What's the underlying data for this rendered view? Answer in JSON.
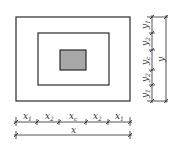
{
  "diagram": {
    "type": "plan-dimension-diagram",
    "colors": {
      "line": "#2a2a2a",
      "fill_center": "#a8a8a8",
      "background": "#ffffff"
    },
    "rects": {
      "outer": {
        "x": 16,
        "y": 17,
        "w": 114,
        "h": 84
      },
      "middle": {
        "x": 38,
        "y": 33,
        "w": 71,
        "h": 52
      },
      "center": {
        "x": 60,
        "y": 50,
        "w": 26,
        "h": 20
      }
    },
    "bottom_dimensions": {
      "segments": [
        {
          "base": "x",
          "sub": "1"
        },
        {
          "base": "x",
          "sub": "2"
        },
        {
          "base": "x",
          "sub": "c"
        },
        {
          "base": "x",
          "sub": "2"
        },
        {
          "base": "x",
          "sub": "1"
        }
      ],
      "total": {
        "base": "x",
        "sub": ""
      }
    },
    "right_dimensions": {
      "segments": [
        {
          "base": "y",
          "sub": "1"
        },
        {
          "base": "y",
          "sub": "2"
        },
        {
          "base": "y",
          "sub": "c"
        },
        {
          "base": "y",
          "sub": "2"
        },
        {
          "base": "y",
          "sub": "1"
        }
      ],
      "total": {
        "base": "y",
        "sub": ""
      }
    }
  }
}
